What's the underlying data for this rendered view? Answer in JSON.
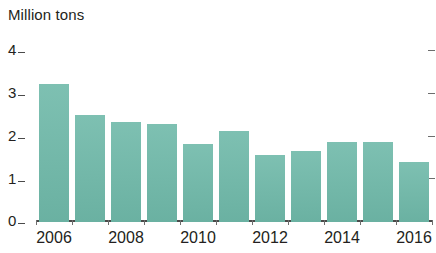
{
  "chart_data": {
    "type": "bar",
    "title": "",
    "ylabel": "Million tons",
    "xlabel": "",
    "categories": [
      "2006",
      "2007",
      "2008",
      "2009",
      "2010",
      "2011",
      "2012",
      "2013",
      "2014",
      "2015",
      "2016"
    ],
    "values": [
      3.1,
      2.4,
      2.25,
      2.2,
      1.75,
      2.05,
      1.5,
      1.6,
      1.8,
      1.8,
      1.35
    ],
    "ylim": [
      0,
      4
    ],
    "y_ticks": [
      "0",
      "1",
      "2",
      "3",
      "4"
    ],
    "y_tick_values": [
      0,
      1,
      2,
      3,
      4
    ],
    "x_tick_labels_shown": [
      "2006",
      "2008",
      "2010",
      "2012",
      "2014",
      "2016"
    ],
    "grid": false,
    "legend": null,
    "series_color": "#6fb9a9",
    "axis_color": "#4a4a4a",
    "text_color": "#231f20",
    "background": "#ffffff"
  }
}
